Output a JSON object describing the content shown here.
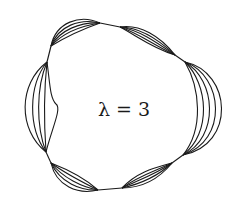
{
  "figure": {
    "label": "λ = 3",
    "stroke_color": "#1a1a1a",
    "background": "#ffffff"
  }
}
